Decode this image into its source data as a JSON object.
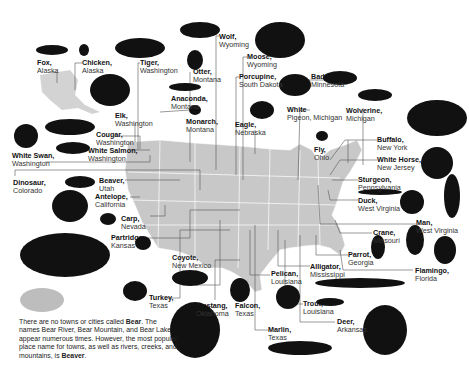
{
  "labels": [
    {
      "id": "fox",
      "animal": "Fox,",
      "place": "Alaska",
      "x": 37,
      "y": 59
    },
    {
      "id": "chicken",
      "animal": "Chicken,",
      "place": "Alaska",
      "x": 82,
      "y": 59
    },
    {
      "id": "tiger",
      "animal": "Tiger,",
      "place": "Washington",
      "x": 140,
      "y": 59
    },
    {
      "id": "wolf",
      "animal": "Wolf,",
      "place": "Wyoming",
      "x": 219,
      "y": 33
    },
    {
      "id": "moose",
      "animal": "Moose,",
      "place": "Wyoming",
      "x": 247,
      "y": 53
    },
    {
      "id": "otter",
      "animal": "Otter,",
      "place": "Montana",
      "x": 193,
      "y": 68
    },
    {
      "id": "porcupine",
      "animal": "Porcupine,",
      "place": "South Dakota",
      "x": 239,
      "y": 73
    },
    {
      "id": "anaconda",
      "animal": "Anaconda,",
      "place": "Montana",
      "x": 171,
      "y": 95
    },
    {
      "id": "monarch",
      "animal": "Monarch,",
      "place": "Montana",
      "x": 186,
      "y": 118
    },
    {
      "id": "eagle",
      "animal": "Eagle,",
      "place": "Nebraska",
      "x": 235,
      "y": 121
    },
    {
      "id": "white-pigeon",
      "animal": "White",
      "place": "Pigeon, Michigan",
      "x": 287,
      "y": 106
    },
    {
      "id": "badger",
      "animal": "Badger,",
      "place": "Minnesota",
      "x": 311,
      "y": 73
    },
    {
      "id": "wolverine",
      "animal": "Wolverine,",
      "place": "Michigan",
      "x": 346,
      "y": 107
    },
    {
      "id": "elk",
      "animal": "Elk,",
      "place": "Washington",
      "x": 115,
      "y": 112
    },
    {
      "id": "cougar",
      "animal": "Cougar,",
      "place": "Washington",
      "x": 96,
      "y": 131
    },
    {
      "id": "white-swan",
      "animal": "White Swan,",
      "place": "Washington",
      "x": 12,
      "y": 152
    },
    {
      "id": "white-salmon",
      "animal": "White Salmon,",
      "place": "Washington",
      "x": 88,
      "y": 147
    },
    {
      "id": "fly",
      "animal": "Fly,",
      "place": "Ohio",
      "x": 314,
      "y": 146
    },
    {
      "id": "buffalo",
      "animal": "Buffalo,",
      "place": "New York",
      "x": 377,
      "y": 136
    },
    {
      "id": "white-horse",
      "animal": "White Horse,",
      "place": "New Jersey",
      "x": 377,
      "y": 156
    },
    {
      "id": "sturgeon",
      "animal": "Sturgeon,",
      "place": "Pennsylvania",
      "x": 358,
      "y": 176
    },
    {
      "id": "duck",
      "animal": "Duck,",
      "place": "West Virginia",
      "x": 358,
      "y": 197
    },
    {
      "id": "man",
      "animal": "Man,",
      "place": "West Virginia",
      "x": 416,
      "y": 219
    },
    {
      "id": "dinosaur",
      "animal": "Dinosaur,",
      "place": "Colorado",
      "x": 13,
      "y": 179
    },
    {
      "id": "beaver",
      "animal": "Beaver,",
      "place": "Utah",
      "x": 99,
      "y": 177
    },
    {
      "id": "antelope",
      "animal": "Antelope,",
      "place": "California",
      "x": 95,
      "y": 193
    },
    {
      "id": "carp",
      "animal": "Carp,",
      "place": "Nevada",
      "x": 121,
      "y": 215
    },
    {
      "id": "partridge",
      "animal": "Partridge,",
      "place": "Kansas",
      "x": 111,
      "y": 234
    },
    {
      "id": "coyote",
      "animal": "Coyote,",
      "place": "New Mexico",
      "x": 172,
      "y": 254
    },
    {
      "id": "turkey",
      "animal": "Turkey,",
      "place": "Texas",
      "x": 149,
      "y": 294
    },
    {
      "id": "mustang",
      "animal": "Mustang,",
      "place": "Oklahoma",
      "x": 196,
      "y": 302
    },
    {
      "id": "falcon",
      "animal": "Falcon,",
      "place": "Texas",
      "x": 235,
      "y": 302
    },
    {
      "id": "pelican",
      "animal": "Pelican,",
      "place": "Louisiana",
      "x": 271,
      "y": 270
    },
    {
      "id": "alligator",
      "animal": "Alligator,",
      "place": "Mississippi",
      "x": 310,
      "y": 263
    },
    {
      "id": "trout",
      "animal": "Trout,",
      "place": "Louisiana",
      "x": 303,
      "y": 300
    },
    {
      "id": "marlin",
      "animal": "Marlin,",
      "place": "Texas",
      "x": 268,
      "y": 326
    },
    {
      "id": "deer",
      "animal": "Deer,",
      "place": "Arkansas",
      "x": 337,
      "y": 318
    },
    {
      "id": "crane",
      "animal": "Crane,",
      "place": "Missouri",
      "x": 373,
      "y": 229
    },
    {
      "id": "parrot",
      "animal": "Parrot,",
      "place": "Georgia",
      "x": 348,
      "y": 251
    },
    {
      "id": "flamingo",
      "animal": "Flamingo,",
      "place": "Florida",
      "x": 415,
      "y": 267
    }
  ],
  "note": {
    "part1": "There are no towns or cities called ",
    "bold1": "Bear",
    "part2": ". The names Bear River, Bear Mountain, and Bear Lake appear numerous times. However, the most popular place name for towns, as well as rivers, creeks, and mountains, is ",
    "bold2": "Beaver",
    "part3": "."
  },
  "colors": {
    "map": "#c8c8c8",
    "silhouette": "#111111",
    "bear": "#bdbdbd",
    "leader": "#555555"
  }
}
